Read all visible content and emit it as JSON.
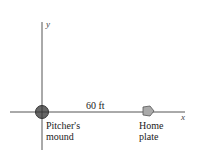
{
  "diagram": {
    "axes": {
      "x_label": "x",
      "y_label": "y"
    },
    "distance_label": "60 ft",
    "pitchers_mound": {
      "line1": "Pitcher's",
      "line2": "mound"
    },
    "home_plate": {
      "line1": "Home",
      "line2": "plate"
    },
    "colors": {
      "axis": "#555555",
      "mound": "#666666",
      "plate": "#999999"
    }
  }
}
